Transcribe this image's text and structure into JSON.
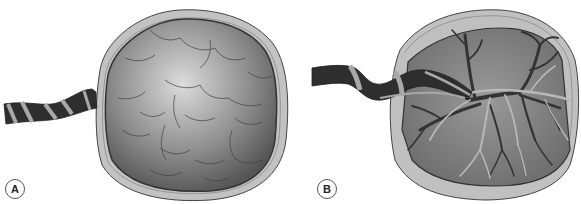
{
  "figure": {
    "panels": [
      {
        "id": "A",
        "label": "A",
        "subject": "placenta-maternal-surface-with-cotyledons"
      },
      {
        "id": "B",
        "label": "B",
        "subject": "placenta-fetal-surface-with-umbilical-vessels"
      }
    ]
  },
  "colors": {
    "background": "#ffffff",
    "membrane": "#bdbdbd",
    "membrane_outline": "#4a4a4a",
    "disc_light": "#d8d8d8",
    "disc_dark": "#5a5a5a",
    "cord_dark": "#2e2e2e",
    "cord_band": "#a8a8a8",
    "vessel": "#333333",
    "vessel_light": "#b0b0b0"
  }
}
